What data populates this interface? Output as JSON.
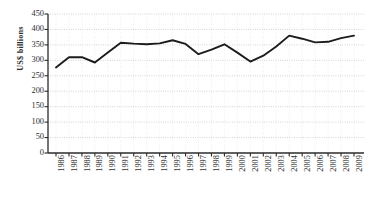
{
  "chart_data": {
    "type": "line",
    "title": "",
    "xlabel": "",
    "ylabel": "US$ billions",
    "ylim": [
      0,
      450
    ],
    "yticks": [
      0,
      50,
      100,
      150,
      200,
      250,
      300,
      350,
      400,
      450
    ],
    "grid": true,
    "legend": "none",
    "line_color": "#1c1c1c",
    "categories": [
      "1986",
      "1987",
      "1988",
      "1989",
      "1990",
      "1991",
      "1992",
      "1993",
      "1994",
      "1995",
      "1996",
      "1997",
      "1998",
      "1999",
      "2000",
      "2001",
      "2002",
      "2003",
      "2004",
      "2005",
      "2006",
      "2007",
      "2008",
      "2009"
    ],
    "values": [
      277,
      310,
      310,
      293,
      325,
      357,
      354,
      352,
      355,
      365,
      353,
      320,
      335,
      352,
      325,
      296,
      315,
      345,
      380,
      370,
      358,
      360,
      372,
      380
    ]
  },
  "caption": {
    "text": ""
  }
}
